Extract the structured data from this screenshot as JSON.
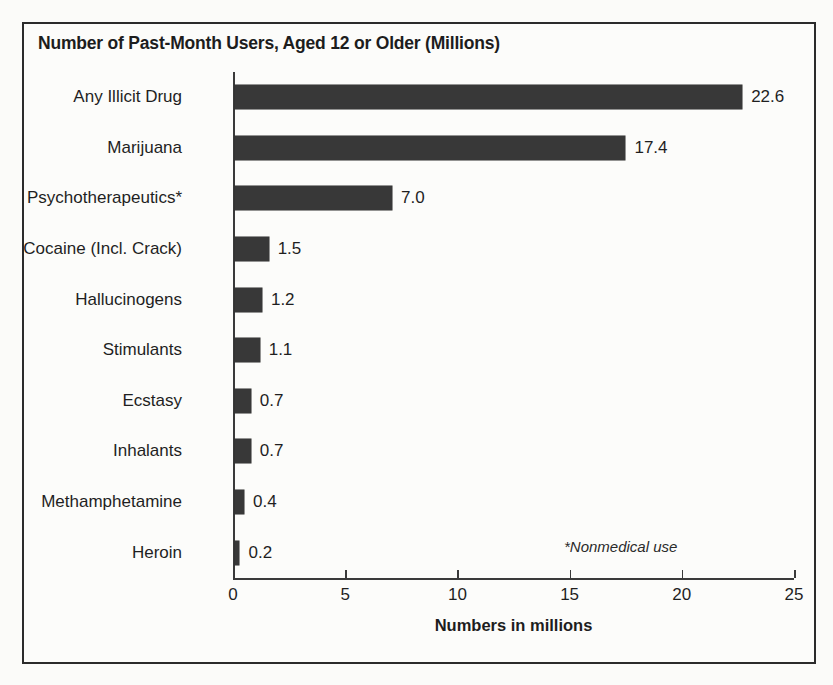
{
  "chart_data": {
    "type": "bar",
    "orientation": "horizontal",
    "title": "Number of Past-Month Users, Aged 12 or Older (Millions)",
    "xlabel": "Numbers in millions",
    "ylabel": "",
    "xlim": [
      0,
      25
    ],
    "xticks": [
      "0",
      "5",
      "10",
      "15",
      "20",
      "25"
    ],
    "xtick_values": [
      0,
      5,
      10,
      15,
      20,
      25
    ],
    "grid": false,
    "legend": null,
    "bar_color": "#383838",
    "footnote": "*Nonmedical use",
    "categories": [
      "Any Illicit Drug",
      "Marijuana",
      "Psychotherapeutics*",
      "Cocaine (Incl. Crack)",
      "Hallucinogens",
      "Stimulants",
      "Ecstasy",
      "Inhalants",
      "Methamphetamine",
      "Heroin"
    ],
    "values": [
      22.6,
      17.4,
      7.0,
      1.5,
      1.2,
      1.1,
      0.7,
      0.7,
      0.4,
      0.2
    ],
    "value_labels": [
      "22.6",
      "17.4",
      "7.0",
      "1.5",
      "1.2",
      "1.1",
      "0.7",
      "0.7",
      "0.4",
      "0.2"
    ]
  }
}
